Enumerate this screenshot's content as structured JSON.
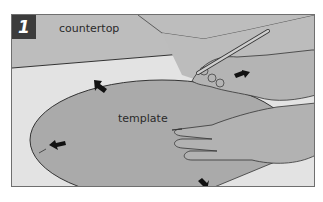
{
  "figure": {
    "step_number": "1",
    "labels": {
      "countertop": "countertop",
      "template": "template"
    },
    "colors": {
      "frame_border": "#6f6f6f",
      "countertop_surface": "#b9b9b9",
      "light_surface": "#e2e2e2",
      "template_fill": "#a9a9a9",
      "hand_fill": "#b3b3b3",
      "badge_bg": "#3c3c3c",
      "arrow": "#111111"
    },
    "elements": [
      "countertop",
      "template",
      "hand-with-pencil",
      "hand-holding-template",
      "direction-arrows"
    ]
  }
}
